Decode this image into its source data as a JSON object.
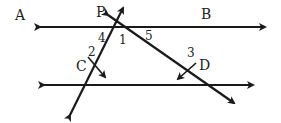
{
  "diagram": {
    "type": "geometry-parallel-lines-transversals",
    "stroke_color": "#1a1a1a",
    "labels": {
      "A": "A",
      "B": "B",
      "P": "P",
      "C": "C",
      "D": "D",
      "angle1": "1",
      "angle2": "2",
      "angle3": "3",
      "angle4": "4",
      "angle5": "5"
    }
  }
}
